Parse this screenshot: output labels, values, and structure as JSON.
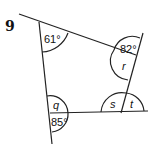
{
  "question": {
    "number": "9"
  },
  "angles": {
    "top_left": "61°",
    "top_right": "82°",
    "right_inner": "r",
    "bottom_left_inner": "q",
    "bottom_left_outer": "85°",
    "bottom_right_inner": "s",
    "bottom_right_outer": "t"
  }
}
